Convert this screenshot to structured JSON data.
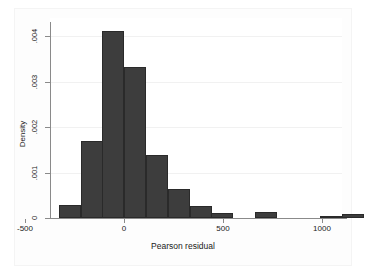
{
  "chart_data": {
    "type": "bar",
    "title": "",
    "subtitle": "",
    "xlabel": "Pearson residual",
    "ylabel": "Density",
    "xlim": [
      -375,
      1125
    ],
    "ylim": [
      0,
      0.00425
    ],
    "grid": true,
    "legend": null,
    "legend_position": "none",
    "bar_color": "#3d3d3d",
    "bar_edge_color": "#2a2a2a",
    "bin_width": 110,
    "x_ticks": [
      -500,
      0,
      500,
      1000
    ],
    "x_tick_labels": [
      "-500",
      "0",
      "500",
      "1000"
    ],
    "y_ticks": [
      0,
      0.001,
      0.002,
      0.003,
      0.004
    ],
    "y_tick_labels": [
      "0",
      ".001",
      ".002",
      ".003",
      ".004"
    ],
    "bins": [
      {
        "left": -330,
        "right": -220,
        "density": 0.00028
      },
      {
        "left": -220,
        "right": -110,
        "density": 0.0017
      },
      {
        "left": -110,
        "right": 0,
        "density": 0.00412
      },
      {
        "left": 0,
        "right": 110,
        "density": 0.00333
      },
      {
        "left": 110,
        "right": 220,
        "density": 0.00139
      },
      {
        "left": 220,
        "right": 330,
        "density": 0.00064
      },
      {
        "left": 330,
        "right": 440,
        "density": 0.00026
      },
      {
        "left": 440,
        "right": 550,
        "density": 0.00011
      },
      {
        "left": 660,
        "right": 770,
        "density": 0.00013
      },
      {
        "left": 990,
        "right": 1100,
        "density": 5e-05
      },
      {
        "left": 1100,
        "right": 1210,
        "density": 9e-05
      }
    ]
  },
  "axes": {
    "y_title": "Density",
    "x_title": "Pearson residual",
    "y_tick_labels": [
      ".004",
      ".003",
      ".002",
      ".001",
      "0"
    ],
    "x_tick_labels": [
      "-500",
      "0",
      "500",
      "1000"
    ]
  }
}
